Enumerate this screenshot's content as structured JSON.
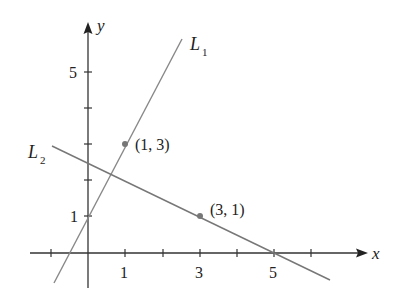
{
  "diagram": {
    "axes": {
      "x_label": "x",
      "y_label": "y"
    },
    "x_ticks": [
      {
        "value": 1,
        "label": "1"
      },
      {
        "value": 3,
        "label": "3"
      },
      {
        "value": 5,
        "label": "5"
      }
    ],
    "y_ticks": [
      {
        "value": 1,
        "label": "1"
      },
      {
        "value": 5,
        "label": "5"
      }
    ],
    "lines": [
      {
        "name": "L",
        "sub": "1",
        "equation": "y = 2x + 1"
      },
      {
        "name": "L",
        "sub": "2",
        "equation": "y = -x/2 + 5/2"
      }
    ],
    "points": [
      {
        "label": "(1, 3)",
        "x": 1,
        "y": 3
      },
      {
        "label": "(3, 1)",
        "x": 3,
        "y": 1
      }
    ],
    "colors": {
      "axis": "#333333",
      "line": "#777777",
      "point": "#777777"
    }
  }
}
